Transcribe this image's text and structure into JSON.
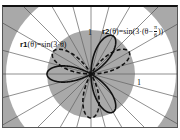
{
  "chart_data": {
    "type": "polar-line",
    "title": "",
    "series": [
      {
        "name": "r1",
        "expression": "r1(θ)=sin(3·θ)",
        "function": "sin(3*t)",
        "style": "dashed",
        "color": "#111111",
        "petal_angles_deg": [
          30,
          150,
          270
        ]
      },
      {
        "name": "r2",
        "expression": "r2(θ)=sin(3·(θ−π/6))",
        "function": "sin(3*(t-pi/6))",
        "style": "solid",
        "color": "#111111",
        "petal_angles_deg": [
          60,
          180,
          300
        ]
      }
    ],
    "theta_range": [
      0,
      6.2832
    ],
    "r_range": [
      0,
      2
    ],
    "radial_tick_labels": [
      "1",
      "1"
    ],
    "spoke_spacing_deg": 15,
    "regions": [
      {
        "name": "inner-disk",
        "radius": 1,
        "color": "#a9a9a9"
      },
      {
        "name": "outer-ring",
        "radius": 1.93,
        "color": "#ffffff"
      },
      {
        "name": "background",
        "color": "#a9a9a9"
      }
    ],
    "grid": true
  },
  "labels": {
    "r1_name": "r1",
    "r1_rest": "(θ)=sin(3·θ)",
    "r2_name": "r2",
    "r2_rest": "(θ)=sin(3·(θ−",
    "r2_pi": "π",
    "r2_six": "6",
    "r2_close": "))",
    "tick_y": "1",
    "tick_x": "1"
  },
  "layout": {
    "center": [
      88,
      67
    ],
    "unit_px": 44,
    "outer_radius_px": 85
  }
}
